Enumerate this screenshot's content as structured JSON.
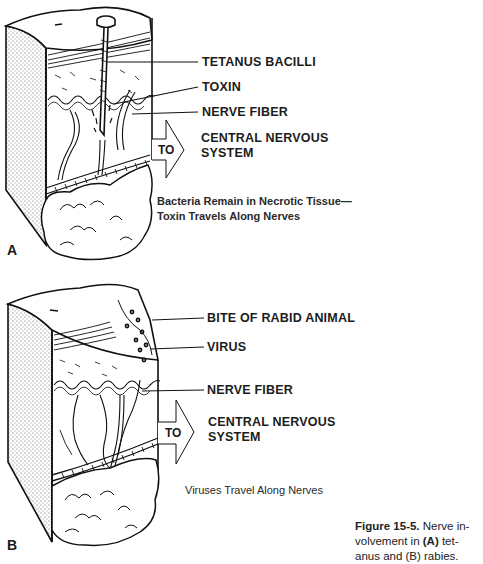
{
  "panel_a": {
    "letter": "A",
    "labels": {
      "tetanus_bacilli": "TETANUS BACILLI",
      "toxin": "TOXIN",
      "nerve_fiber": "NERVE FIBER",
      "cns_line1": "CENTRAL NERVOUS",
      "cns_line2": "SYSTEM"
    },
    "arrow_text": "TO",
    "description_line1": "Bacteria Remain in Necrotic Tissue—",
    "description_line2": "Toxin Travels Along Nerves"
  },
  "panel_b": {
    "letter": "B",
    "labels": {
      "bite": "BITE OF RABID ANIMAL",
      "virus": "VIRUS",
      "nerve_fiber": "NERVE FIBER",
      "cns_line1": "CENTRAL NERVOUS",
      "cns_line2": "SYSTEM"
    },
    "arrow_text": "TO",
    "description": "Viruses Travel Along Nerves"
  },
  "figure_caption": {
    "number": "Figure 15-5.",
    "text_line1": " Nerve in-",
    "text_line2_pre": "volvement in ",
    "text_line2_a": "(A)",
    "text_line2_post": " tet-",
    "text_line3": "anus and (B) rabies."
  }
}
